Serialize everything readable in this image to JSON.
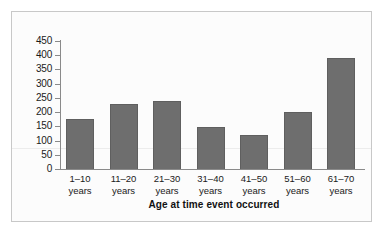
{
  "chart_data": {
    "type": "bar",
    "title": "",
    "xlabel": "Age at time event occurred",
    "ylabel": "",
    "categories": [
      "1–10 years",
      "11–20 years",
      "21–30 years",
      "31–40 years",
      "41–50 years",
      "51–60 years",
      "61–70 years"
    ],
    "category_lines": [
      [
        "1–10",
        "years"
      ],
      [
        "11–20",
        "years"
      ],
      [
        "21–30",
        "years"
      ],
      [
        "31–40",
        "years"
      ],
      [
        "41–50",
        "years"
      ],
      [
        "51–60",
        "years"
      ],
      [
        "61–70",
        "years"
      ]
    ],
    "values": [
      175,
      229,
      239,
      148,
      118,
      200,
      390
    ],
    "ylim": [
      0,
      450
    ],
    "ytick_labels": [
      "450",
      "400",
      "350",
      "300",
      "250",
      "200",
      "150",
      "100",
      "50",
      "0"
    ],
    "ytick_values": [
      450,
      400,
      350,
      300,
      250,
      200,
      150,
      100,
      50,
      0
    ],
    "ytick_step": 50,
    "grid": false,
    "legend": null,
    "bar_color": "#6e6e6e",
    "bar_edge_color": "#5f5f5f",
    "axis_color": "#8a8a8a",
    "plot_background": "#fcfcfc",
    "frame_color": "#c8c8c8"
  }
}
